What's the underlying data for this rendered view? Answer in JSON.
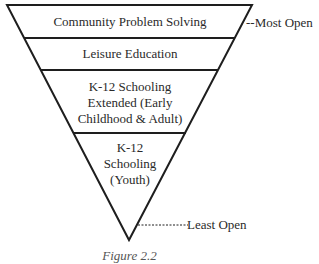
{
  "diagram": {
    "type": "inverted-pyramid",
    "levels": [
      {
        "label": "Community Problem Solving"
      },
      {
        "label": "Leisure Education"
      },
      {
        "label": "K-12 Schooling Extended (Early Childhood & Adult)",
        "lines": [
          "K-12 Schooling",
          "Extended (Early",
          "Childhood & Adult)"
        ]
      },
      {
        "label": "K-12 Schooling (Youth)",
        "lines": [
          "K-12",
          "Schooling",
          "(Youth)"
        ]
      }
    ],
    "annotations": {
      "top": "--Most Open",
      "bottom": "-----------Least Open"
    },
    "caption": "Figure 2.2",
    "colors": {
      "line": "#1e1e1e",
      "text": "#2a2a2a",
      "background": "#ffffff"
    }
  }
}
